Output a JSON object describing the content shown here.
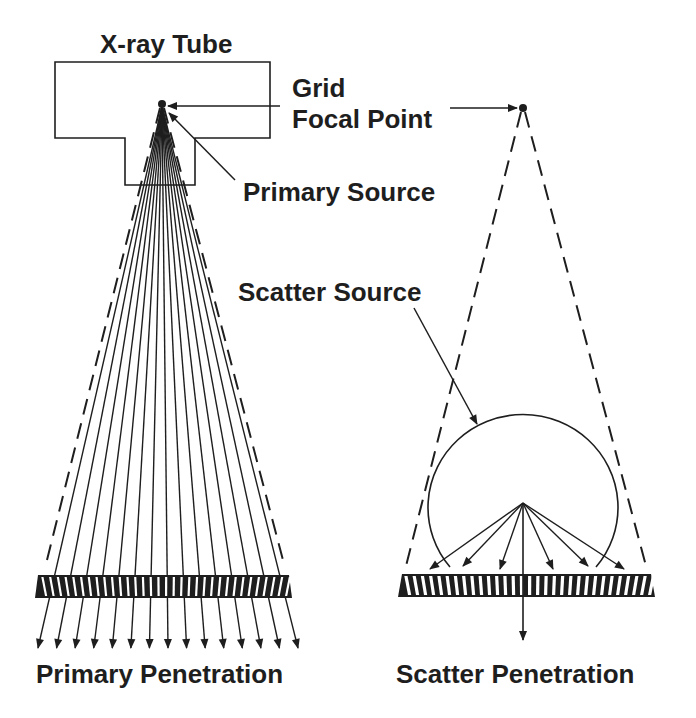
{
  "labels": {
    "xray_tube": "X-ray Tube",
    "grid_line1": "Grid",
    "grid_line2": "Focal Point",
    "primary_source": "Primary Source",
    "scatter_source": "Scatter Source",
    "primary_penetration": "Primary Penetration",
    "scatter_penetration": "Scatter Penetration"
  },
  "colors": {
    "ink": "#1e1e1e",
    "background": "#ffffff"
  },
  "primary_beam": {
    "ray_count": 15,
    "focal_point": [
      162,
      104
    ]
  },
  "scatter": {
    "focal_point": [
      523,
      108
    ],
    "scatter_arrow_count": 7
  }
}
